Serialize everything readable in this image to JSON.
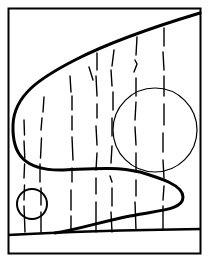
{
  "diagram": {
    "colors": {
      "ink": "#000000",
      "background": "#ffffff"
    },
    "frame": {
      "x": 8,
      "y": 8,
      "width": 193,
      "height": 246
    },
    "bottom_band_line": {
      "x1": 8,
      "y1": 235,
      "x2": 201,
      "y2": 229
    },
    "s_curve": "M 200 13 C 150 28, 110 42, 75 60 C 40 78, 14 95, 13 125 C 12 155, 25 170, 60 170 C 90 169, 115 166, 140 172 C 160 178, 183 185, 183 197 C 183 210, 160 210, 130 216 C 100 222, 80 229, 55 233",
    "circles": [
      {
        "name": "large-circle",
        "cx": 155,
        "cy": 130,
        "r": 42
      },
      {
        "name": "small-circle",
        "cx": 32,
        "cy": 204,
        "r": 15
      }
    ],
    "vertical_strokes_x": [
      24,
      41,
      71,
      97,
      112,
      136,
      164
    ]
  }
}
